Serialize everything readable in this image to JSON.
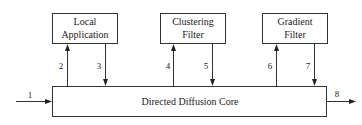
{
  "diagram": {
    "type": "block-diagram",
    "nodes": [
      {
        "id": "local",
        "lines": [
          "Local",
          "Application"
        ]
      },
      {
        "id": "cluster",
        "lines": [
          "Clustering",
          "Filter"
        ]
      },
      {
        "id": "gradient",
        "lines": [
          "Gradient",
          "Filter"
        ]
      },
      {
        "id": "core",
        "lines": [
          "Directed Diffusion Core"
        ]
      }
    ],
    "edges": [
      {
        "label": "1",
        "from": "external",
        "to": "core"
      },
      {
        "label": "2",
        "from": "core",
        "to": "local"
      },
      {
        "label": "3",
        "from": "local",
        "to": "core"
      },
      {
        "label": "4",
        "from": "core",
        "to": "cluster"
      },
      {
        "label": "5",
        "from": "cluster",
        "to": "core"
      },
      {
        "label": "6",
        "from": "core",
        "to": "gradient"
      },
      {
        "label": "7",
        "from": "gradient",
        "to": "core"
      },
      {
        "label": "8",
        "from": "core",
        "to": "external"
      }
    ]
  }
}
